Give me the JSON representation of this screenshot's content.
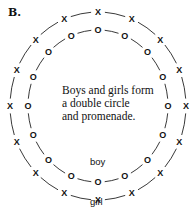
{
  "figure": {
    "label": "B.",
    "caption_lines": [
      "Boys and girls form",
      "a double circle",
      "and promenade."
    ],
    "inner_label": "boy",
    "outer_label": "girl",
    "outer_symbol": "X",
    "inner_symbol": "O",
    "outer_count": 16,
    "inner_count": 16,
    "line_color": "#222222"
  }
}
